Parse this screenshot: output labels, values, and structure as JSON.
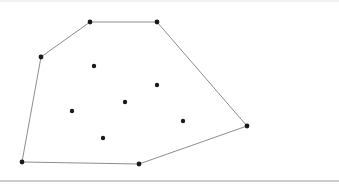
{
  "figure": {
    "kind": "convex-hull-point-set",
    "title": "",
    "caption": "",
    "width": 339,
    "height": 187,
    "background_color": "#ffffff"
  },
  "style": {
    "hull_edge_color": "#707070",
    "hull_edge_width": 0.8,
    "hull_fill": "none",
    "point_color": "#1a1a1a",
    "point_radius": 2.2,
    "vertex_radius": 2.4,
    "top_rule_color": "#e3e3e6",
    "bottom_rule_color": "#9a9a9e",
    "bottom_rule_width": 1.1
  },
  "chart_data": {
    "type": "scatter",
    "title": "",
    "xlabel": "",
    "ylabel": "",
    "grid": false,
    "legend": null,
    "xlim": [
      0,
      339
    ],
    "ylim": [
      0,
      187
    ],
    "hull_vertices": [
      {
        "id": "V1",
        "label": "",
        "x": 90,
        "y": 22,
        "role": "hull-vertex"
      },
      {
        "id": "V2",
        "label": "",
        "x": 157,
        "y": 22,
        "role": "hull-vertex"
      },
      {
        "id": "V3",
        "label": "",
        "x": 247,
        "y": 126,
        "role": "hull-vertex"
      },
      {
        "id": "V4",
        "label": "",
        "x": 139,
        "y": 164,
        "role": "hull-vertex"
      },
      {
        "id": "V5",
        "label": "",
        "x": 22,
        "y": 162,
        "role": "hull-vertex"
      },
      {
        "id": "V6",
        "label": "",
        "x": 41,
        "y": 57,
        "role": "hull-vertex"
      }
    ],
    "interior_points": [
      {
        "id": "P1",
        "label": "",
        "x": 94,
        "y": 66,
        "role": "interior-point"
      },
      {
        "id": "P2",
        "label": "",
        "x": 157,
        "y": 85,
        "role": "interior-point"
      },
      {
        "id": "P3",
        "label": "",
        "x": 125,
        "y": 102,
        "role": "interior-point"
      },
      {
        "id": "P4",
        "label": "",
        "x": 72,
        "y": 111,
        "role": "interior-point"
      },
      {
        "id": "P5",
        "label": "",
        "x": 183,
        "y": 121,
        "role": "interior-point"
      },
      {
        "id": "P6",
        "label": "",
        "x": 103,
        "y": 138,
        "role": "interior-point"
      }
    ],
    "hull_edges": [
      {
        "from": "V1",
        "to": "V2"
      },
      {
        "from": "V2",
        "to": "V3"
      },
      {
        "from": "V3",
        "to": "V4"
      },
      {
        "from": "V4",
        "to": "V5"
      },
      {
        "from": "V5",
        "to": "V6"
      },
      {
        "from": "V6",
        "to": "V1"
      }
    ],
    "counts": {
      "total_points": 12,
      "hull_vertices": 6,
      "interior_points": 6
    }
  },
  "rules": {
    "top": {
      "x1": 0,
      "y1": 1,
      "x2": 339,
      "y2": 1
    },
    "bottom": {
      "x1": 0,
      "y1": 181,
      "x2": 339,
      "y2": 181
    }
  }
}
